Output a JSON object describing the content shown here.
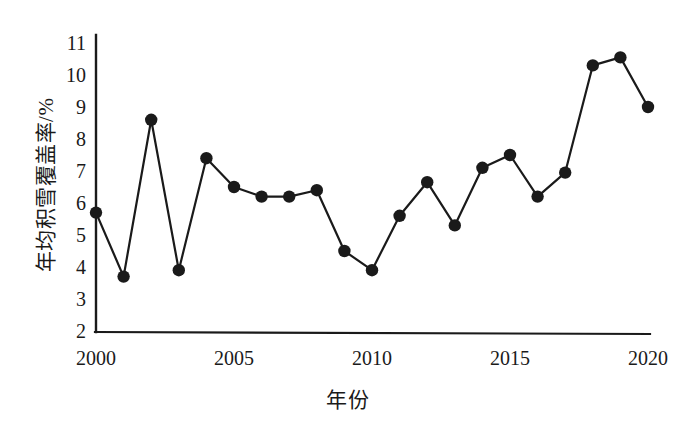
{
  "chart_data": {
    "type": "line",
    "title": "",
    "xlabel": "年份",
    "ylabel": "年均积雪覆盖率/%",
    "xlim": [
      2000,
      2020
    ],
    "ylim": [
      2,
      11
    ],
    "grid": false,
    "legend": "none",
    "marker": "filled-circle",
    "line_color": "#1a1a1a",
    "marker_color": "#1a1a1a",
    "x": [
      2000,
      2001,
      2002,
      2003,
      2004,
      2005,
      2006,
      2007,
      2008,
      2009,
      2010,
      2011,
      2012,
      2013,
      2014,
      2015,
      2016,
      2017,
      2018,
      2019,
      2020
    ],
    "values": [
      5.7,
      3.7,
      8.6,
      3.9,
      7.4,
      6.5,
      6.2,
      6.2,
      6.4,
      4.5,
      3.9,
      5.6,
      6.65,
      5.3,
      7.1,
      7.5,
      6.2,
      6.95,
      10.3,
      10.55,
      9.0
    ],
    "xticks": [
      2000,
      2005,
      2010,
      2015,
      2020
    ],
    "xtick_labels": [
      "2000",
      "2005",
      "2010",
      "2015",
      "2020"
    ],
    "yticks": [
      2,
      3,
      4,
      5,
      6,
      7,
      8,
      9,
      10,
      11
    ],
    "ytick_labels": [
      "2",
      "3",
      "4",
      "5",
      "6",
      "7",
      "8",
      "9",
      "10",
      "11"
    ]
  },
  "axis": {
    "y_title": "年均积雪覆盖率/%",
    "x_title": "年份",
    "y_labels": {
      "t11": "11",
      "t10": "10",
      "t9": "9",
      "t8": "8",
      "t7": "7",
      "t6": "6",
      "t5": "5",
      "t4": "4",
      "t3": "3",
      "t2": "2"
    },
    "x_labels": {
      "t2000": "2000",
      "t2005": "2005",
      "t2010": "2010",
      "t2015": "2015",
      "t2020": "2020"
    }
  }
}
